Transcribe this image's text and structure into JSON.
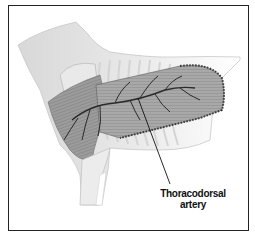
{
  "figure": {
    "labels": [
      {
        "id": "thoracodorsal-artery",
        "line1": "Thoracodorsal",
        "line2": "artery"
      }
    ]
  },
  "colors": {
    "frame": "#222222",
    "skin": "#e6e6e6",
    "muscle": "#9a9a9a",
    "ribs": "#f2f2f2",
    "vessel": "#2a2a2a",
    "dotted_outline": "#3a3a3a"
  }
}
